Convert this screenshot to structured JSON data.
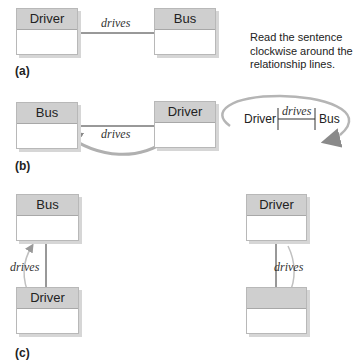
{
  "panel_a": {
    "label": "(a)",
    "left_entity": "Driver",
    "right_entity": "Bus",
    "relationship": "drives"
  },
  "note": {
    "text": "Read the sentence clockwise around the relationship lines.",
    "sentence": {
      "subject": "Driver",
      "verb": "drives",
      "object": "Bus"
    }
  },
  "panel_b": {
    "label": "(b)",
    "left_entity": "Bus",
    "right_entity": "Driver",
    "relationship": "drives"
  },
  "panel_c": {
    "label": "(c)",
    "left_column": {
      "top_entity": "Bus",
      "bottom_entity": "Driver",
      "relationship": "drives"
    },
    "right_column": {
      "top_entity": "Driver",
      "bottom_entity": "",
      "relationship": "drives"
    }
  },
  "colors": {
    "header_fill": "#cfcfcf",
    "box_border": "#b8b8b8",
    "arrow": "#bdbdbd",
    "line": "#333333"
  }
}
